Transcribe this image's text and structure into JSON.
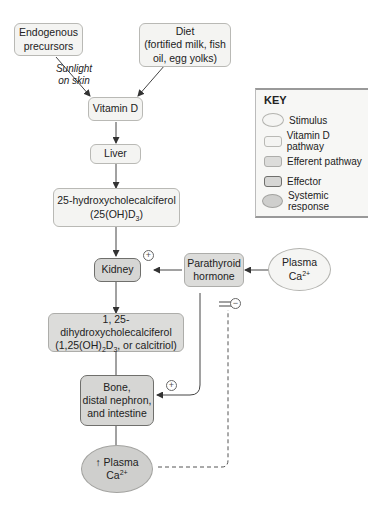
{
  "nodes": {
    "endogenous": "Endogenous precursors",
    "endogenous_l1": "Endogenous",
    "endogenous_l2": "precursors",
    "diet_l1": "Diet",
    "diet_l2": "(fortified milk, fish",
    "diet_l3": "oil, egg yolks)",
    "sunlight_l1": "Sunlight",
    "sunlight_l2": "on skin",
    "vitamin_d": "Vitamin D",
    "liver": "Liver",
    "hydroxy_l1": "25-hydroxycholecalciferol",
    "hydroxy_l2_a": "(25(OH)D",
    "hydroxy_l2_sub": "3",
    "hydroxy_l2_b": ")",
    "kidney": "Kidney",
    "pth_l1": "Parathyroid",
    "pth_l2": "hormone",
    "plasma_l1": "Plasma",
    "plasma_l2": "Ca",
    "plasma_sup": "2+",
    "calcitriol_l1": "1, 25-dihydroxycholecalciferol",
    "calcitriol_l2_a": "(1,25(OH)",
    "calcitriol_l2_sub1": "2",
    "calcitriol_l2_b": "D",
    "calcitriol_l2_sub2": "3",
    "calcitriol_l2_c": ", or calcitriol)",
    "effectors_l1": "Bone,",
    "effectors_l2": "distal nephron,",
    "effectors_l3": "and intestine",
    "response_arrow": "↑",
    "response_l1": "Plasma",
    "response_l2": "Ca",
    "response_sup": "2+"
  },
  "signs": {
    "plus": "+",
    "minus": "−"
  },
  "key": {
    "title": "KEY",
    "items": [
      {
        "label": "Stimulus",
        "type": "stimulus"
      },
      {
        "label": "Vitamin D pathway",
        "type": "vitamin-d-pathway"
      },
      {
        "label": "Efferent pathway",
        "type": "efferent-pathway"
      },
      {
        "label": "Effector",
        "type": "effector"
      },
      {
        "label": "Systemic response",
        "type": "systemic-response"
      }
    ]
  },
  "colors": {
    "vitamin_d_pathway": "#f4f4f2",
    "efferent_pathway": "#dcdcda",
    "effector": "#d6d6d4",
    "systemic_response": "#cfcfcd",
    "stimulus": "#f5f5f3"
  }
}
